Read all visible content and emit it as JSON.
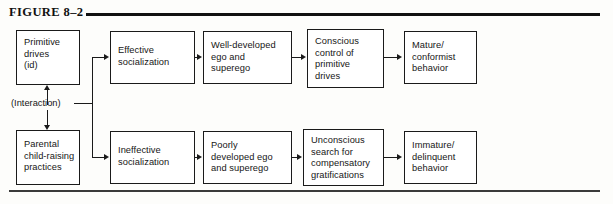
{
  "figure": {
    "title": "FIGURE 8–2",
    "interaction_label": "(Interaction)"
  },
  "nodes": {
    "primitive_drives": "Primitive\ndrives\n(id)",
    "effective_socialization": "Effective\nsocialization",
    "well_developed_ego": "Well-developed\nego and\nsuperego",
    "conscious_control": "Conscious\ncontrol of\nprimitive\ndrives",
    "mature_behavior": "Mature/\nconformist\nbehavior",
    "parental_practices": "Parental\nchild-raising\npractices",
    "ineffective_socialization": "Ineffective\nsocialization",
    "poorly_developed_ego": "Poorly\ndeveloped ego\nand superego",
    "unconscious_search": "Unconscious\nsearch for\ncompensatory\ngratifications",
    "immature_behavior": "Immature/\ndelinquent\nbehavior"
  },
  "colors": {
    "ink": "#1a1a1a",
    "background": "#fdfdfb",
    "rule": "#111111"
  }
}
